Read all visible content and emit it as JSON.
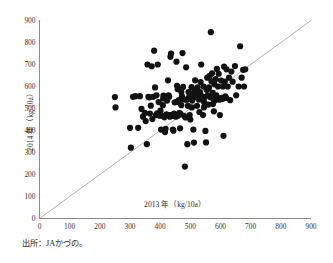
{
  "figure": {
    "source_note": "出所：JAかづの。"
  },
  "chart_data": {
    "type": "scatter",
    "title": "",
    "xlabel": "2013 年（kg/10a）",
    "ylabel": "2014 年（kg/10a）",
    "xlim": [
      0,
      900
    ],
    "ylim": [
      0,
      900
    ],
    "xticks": [
      0,
      100,
      200,
      300,
      400,
      500,
      600,
      700,
      800,
      900
    ],
    "yticks": [
      0,
      100,
      200,
      300,
      400,
      500,
      600,
      700,
      800,
      900
    ],
    "grid": false,
    "legend": "none",
    "marker_color": "#121212",
    "marker_size_px": 3.1,
    "reference_line": {
      "name": "y = x diagonal",
      "from": [
        0,
        0
      ],
      "to": [
        900,
        900
      ],
      "color": "#9a9a9a"
    },
    "points": [
      [
        250,
        552
      ],
      [
        252,
        505
      ],
      [
        300,
        412
      ],
      [
        303,
        322
      ],
      [
        310,
        553
      ],
      [
        318,
        556
      ],
      [
        327,
        412
      ],
      [
        333,
        556
      ],
      [
        338,
        498
      ],
      [
        343,
        463
      ],
      [
        349,
        480
      ],
      [
        352,
        443
      ],
      [
        356,
        338
      ],
      [
        358,
        700
      ],
      [
        361,
        553
      ],
      [
        364,
        551
      ],
      [
        366,
        477
      ],
      [
        369,
        513
      ],
      [
        372,
        692
      ],
      [
        374,
        452
      ],
      [
        377,
        553
      ],
      [
        380,
        763
      ],
      [
        383,
        596
      ],
      [
        386,
        470
      ],
      [
        388,
        560
      ],
      [
        390,
        478
      ],
      [
        392,
        700
      ],
      [
        395,
        529
      ],
      [
        398,
        467
      ],
      [
        401,
        490
      ],
      [
        403,
        404
      ],
      [
        406,
        468
      ],
      [
        409,
        515
      ],
      [
        411,
        559
      ],
      [
        414,
        460
      ],
      [
        416,
        393
      ],
      [
        418,
        408
      ],
      [
        421,
        473
      ],
      [
        423,
        536
      ],
      [
        426,
        628
      ],
      [
        428,
        560
      ],
      [
        430,
        470
      ],
      [
        432,
        463
      ],
      [
        434,
        735
      ],
      [
        436,
        750
      ],
      [
        438,
        470
      ],
      [
        440,
        466
      ],
      [
        442,
        404
      ],
      [
        444,
        399
      ],
      [
        446,
        477
      ],
      [
        448,
        528
      ],
      [
        450,
        469
      ],
      [
        452,
        463
      ],
      [
        454,
        713
      ],
      [
        456,
        603
      ],
      [
        458,
        588
      ],
      [
        460,
        468
      ],
      [
        462,
        538
      ],
      [
        464,
        480
      ],
      [
        466,
        410
      ],
      [
        468,
        474
      ],
      [
        470,
        576
      ],
      [
        472,
        556
      ],
      [
        474,
        752
      ],
      [
        476,
        598
      ],
      [
        478,
        541
      ],
      [
        480,
        466
      ],
      [
        482,
        236
      ],
      [
        484,
        459
      ],
      [
        486,
        687
      ],
      [
        488,
        540
      ],
      [
        490,
        338
      ],
      [
        492,
        512
      ],
      [
        494,
        575
      ],
      [
        496,
        552
      ],
      [
        498,
        470
      ],
      [
        500,
        450
      ],
      [
        502,
        565
      ],
      [
        504,
        597
      ],
      [
        506,
        536
      ],
      [
        508,
        553
      ],
      [
        510,
        404
      ],
      [
        512,
        345
      ],
      [
        514,
        584
      ],
      [
        516,
        628
      ],
      [
        518,
        561
      ],
      [
        520,
        553
      ],
      [
        522,
        512
      ],
      [
        524,
        596
      ],
      [
        526,
        558
      ],
      [
        528,
        541
      ],
      [
        530,
        484
      ],
      [
        532,
        574
      ],
      [
        534,
        620
      ],
      [
        536,
        700
      ],
      [
        538,
        556
      ],
      [
        540,
        540
      ],
      [
        542,
        470
      ],
      [
        544,
        600
      ],
      [
        546,
        528
      ],
      [
        548,
        552
      ],
      [
        550,
        398
      ],
      [
        552,
        346
      ],
      [
        554,
        585
      ],
      [
        556,
        640
      ],
      [
        558,
        560
      ],
      [
        560,
        518
      ],
      [
        562,
        596
      ],
      [
        564,
        648
      ],
      [
        566,
        552
      ],
      [
        568,
        847
      ],
      [
        570,
        624
      ],
      [
        572,
        660
      ],
      [
        574,
        571
      ],
      [
        576,
        543
      ],
      [
        578,
        487
      ],
      [
        580,
        610
      ],
      [
        582,
        538
      ],
      [
        584,
        634
      ],
      [
        586,
        560
      ],
      [
        588,
        680
      ],
      [
        590,
        544
      ],
      [
        592,
        600
      ],
      [
        594,
        658
      ],
      [
        596,
        540
      ],
      [
        598,
        470
      ],
      [
        600,
        545
      ],
      [
        602,
        627
      ],
      [
        604,
        548
      ],
      [
        606,
        543
      ],
      [
        608,
        600
      ],
      [
        610,
        376
      ],
      [
        612,
        690
      ],
      [
        614,
        622
      ],
      [
        616,
        555
      ],
      [
        618,
        548
      ],
      [
        620,
        678
      ],
      [
        624,
        600
      ],
      [
        628,
        640
      ],
      [
        632,
        538
      ],
      [
        636,
        668
      ],
      [
        640,
        622
      ],
      [
        648,
        693
      ],
      [
        652,
        560
      ],
      [
        660,
        600
      ],
      [
        665,
        783
      ],
      [
        670,
        640
      ],
      [
        675,
        676
      ],
      [
        678,
        600
      ],
      [
        682,
        678
      ],
      [
        410,
        546
      ],
      [
        430,
        553
      ],
      [
        455,
        530
      ],
      [
        470,
        515
      ],
      [
        486,
        541
      ],
      [
        505,
        505
      ],
      [
        520,
        580
      ],
      [
        545,
        505
      ],
      [
        560,
        590
      ],
      [
        575,
        520
      ]
    ]
  }
}
